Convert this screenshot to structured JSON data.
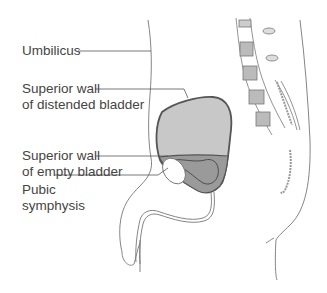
{
  "diagram": {
    "labels": {
      "umbilicus": "Umbilicus",
      "superior_wall_distended_line1": "Superior wall",
      "superior_wall_distended_line2": "of distended bladder",
      "superior_wall_empty_line1": "Superior wall",
      "superior_wall_empty_line2": "of empty bladder",
      "pubic_symphysis_line1": "Pubic",
      "pubic_symphysis_line2": "symphysis"
    },
    "colors": {
      "line": "#666666",
      "distended_bladder_fill": "#c8c8c8",
      "empty_bladder_fill": "#9a9a9a",
      "bladder_outline": "#555555",
      "vertebra_fill": "#bbbbbb",
      "text": "#444444"
    }
  }
}
